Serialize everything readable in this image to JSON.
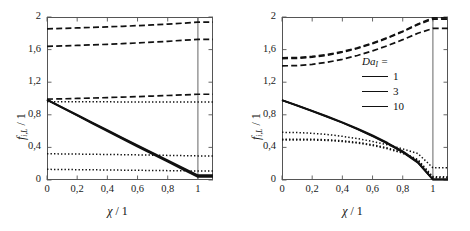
{
  "figure": {
    "panels": [
      {
        "id": "left",
        "axis": {
          "xlabel_sym": "χ",
          "xlabel_unit": "/ 1",
          "ylabel_sym": "f",
          "ylabel_subscript": "i,L",
          "ylabel_unit": "/ 1",
          "xticks": [
            "0",
            "0,2",
            "0,4",
            "0,6",
            "0,8",
            "1"
          ],
          "xtick_values": [
            0,
            0.2,
            0.4,
            0.6,
            0.8,
            1
          ],
          "yticks": [
            "0",
            "0,4",
            "0,8",
            "1,2",
            "1,6",
            "2"
          ],
          "ytick_values": [
            0,
            0.4,
            0.8,
            1.2,
            1.6,
            2
          ]
        }
      },
      {
        "id": "right",
        "axis": {
          "xlabel_sym": "χ",
          "xlabel_unit": "/ 1",
          "ylabel_sym": "f",
          "ylabel_subscript": "i,L",
          "ylabel_unit": "/ 1",
          "xticks": [
            "0",
            "0,2",
            "0,4",
            "0,6",
            "0,8",
            "1"
          ],
          "xtick_values": [
            0,
            0.2,
            0.4,
            0.6,
            0.8,
            1
          ],
          "yticks": [
            "0",
            "0,4",
            "0,8",
            "1,2",
            "1,6",
            "2"
          ],
          "ytick_values": [
            0,
            0.4,
            0.8,
            1.2,
            1.6,
            2
          ]
        },
        "legend": {
          "title_sym": "Da",
          "title_subscript": "I",
          "title_eq": "=",
          "entries": [
            {
              "label": "1",
              "width": 1.6
            },
            {
              "label": "3",
              "width": 1.6
            },
            {
              "label": "10",
              "width": 1.6
            }
          ]
        }
      }
    ]
  },
  "chart_data": [
    {
      "type": "line",
      "panel": "left",
      "title": "",
      "xlabel": "χ / 1",
      "ylabel": "f_{i,L} / 1",
      "xlim": [
        0,
        1.1
      ],
      "ylim": [
        0,
        2
      ],
      "xticks": [
        0,
        0.2,
        0.4,
        0.6,
        0.8,
        1
      ],
      "yticks": [
        0,
        0.4,
        0.8,
        1.2,
        1.6,
        2
      ],
      "grid": false,
      "legend_position": "none",
      "x": [
        0,
        0.1,
        0.2,
        0.3,
        0.4,
        0.5,
        0.6,
        0.7,
        0.8,
        0.9,
        1.0,
        1.05,
        1.1
      ],
      "series": [
        {
          "name": "dashed-upper-DaI-10",
          "style": "dashed",
          "values": [
            1.855,
            1.86,
            1.866,
            1.872,
            1.879,
            1.886,
            1.894,
            1.903,
            1.913,
            1.924,
            1.936,
            1.936,
            1.936
          ]
        },
        {
          "name": "dashed-mid-DaI-3",
          "style": "dashed",
          "values": [
            1.64,
            1.645,
            1.651,
            1.658,
            1.665,
            1.673,
            1.682,
            1.692,
            1.702,
            1.714,
            1.726,
            1.726,
            1.726
          ]
        },
        {
          "name": "dashed-low-DaI-1",
          "style": "dashed",
          "values": [
            0.992,
            0.996,
            1.001,
            1.006,
            1.011,
            1.017,
            1.023,
            1.03,
            1.037,
            1.044,
            1.052,
            1.052,
            1.052
          ]
        },
        {
          "name": "dotted-upper-DaI-1",
          "style": "dotted",
          "values": [
            0.96,
            0.96,
            0.96,
            0.959,
            0.959,
            0.958,
            0.958,
            0.957,
            0.957,
            0.956,
            0.956,
            0.956,
            0.956
          ]
        },
        {
          "name": "dotted-mid-DaI-3",
          "style": "dotted",
          "values": [
            0.322,
            0.32,
            0.318,
            0.316,
            0.313,
            0.311,
            0.308,
            0.305,
            0.302,
            0.299,
            0.296,
            0.296,
            0.296
          ]
        },
        {
          "name": "dotted-low-DaI-10",
          "style": "dotted",
          "values": [
            0.131,
            0.129,
            0.127,
            0.125,
            0.123,
            0.121,
            0.119,
            0.117,
            0.115,
            0.113,
            0.11,
            0.11,
            0.11
          ]
        },
        {
          "name": "solid-DaI-1",
          "style": "solid",
          "values": [
            0.988,
            0.894,
            0.8,
            0.706,
            0.613,
            0.52,
            0.427,
            0.334,
            0.242,
            0.15,
            0.06,
            0.06,
            0.06
          ]
        },
        {
          "name": "solid-DaI-3",
          "style": "solid",
          "values": [
            0.985,
            0.89,
            0.795,
            0.7,
            0.606,
            0.512,
            0.418,
            0.325,
            0.232,
            0.14,
            0.048,
            0.048,
            0.048
          ]
        },
        {
          "name": "solid-DaI-10",
          "style": "solid",
          "values": [
            0.982,
            0.886,
            0.79,
            0.694,
            0.599,
            0.504,
            0.409,
            0.315,
            0.222,
            0.129,
            0.037,
            0.037,
            0.037
          ]
        }
      ]
    },
    {
      "type": "line",
      "panel": "right",
      "title": "",
      "xlabel": "χ / 1",
      "ylabel": "f_{i,L} / 1",
      "xlim": [
        0,
        1.1
      ],
      "ylim": [
        0,
        2
      ],
      "xticks": [
        0,
        0.2,
        0.4,
        0.6,
        0.8,
        1
      ],
      "yticks": [
        0,
        0.4,
        0.8,
        1.2,
        1.6,
        2
      ],
      "grid": false,
      "legend_position": "center-right",
      "legend_entries": [
        "1",
        "3",
        "10"
      ],
      "legend_title": "Da_I =",
      "x": [
        0,
        0.1,
        0.2,
        0.3,
        0.4,
        0.5,
        0.6,
        0.7,
        0.8,
        0.9,
        1.0,
        1.05,
        1.1
      ],
      "series": [
        {
          "name": "dashed-DaI-10",
          "style": "dashed",
          "values": [
            1.5,
            1.503,
            1.516,
            1.54,
            1.576,
            1.622,
            1.68,
            1.748,
            1.826,
            1.913,
            1.99,
            1.99,
            1.99
          ]
        },
        {
          "name": "dashed-DaI-3",
          "style": "dashed",
          "values": [
            1.49,
            1.493,
            1.507,
            1.531,
            1.567,
            1.614,
            1.672,
            1.741,
            1.82,
            1.906,
            1.975,
            1.975,
            1.975
          ]
        },
        {
          "name": "dashed-DaI-1",
          "style": "dashed",
          "values": [
            1.4,
            1.404,
            1.419,
            1.445,
            1.481,
            1.528,
            1.584,
            1.649,
            1.722,
            1.8,
            1.86,
            1.86,
            1.86
          ]
        },
        {
          "name": "dotted-DaI-1",
          "style": "dotted",
          "values": [
            0.585,
            0.582,
            0.573,
            0.558,
            0.536,
            0.508,
            0.473,
            0.431,
            0.382,
            0.325,
            0.15,
            0.15,
            0.15
          ]
        },
        {
          "name": "dotted-DaI-3",
          "style": "dotted",
          "values": [
            0.5,
            0.501,
            0.5,
            0.494,
            0.482,
            0.462,
            0.433,
            0.392,
            0.337,
            0.251,
            0.04,
            0.04,
            0.04
          ]
        },
        {
          "name": "dotted-DaI-10",
          "style": "dotted",
          "values": [
            0.49,
            0.492,
            0.491,
            0.485,
            0.473,
            0.453,
            0.424,
            0.383,
            0.328,
            0.243,
            0.028,
            0.028,
            0.028
          ]
        },
        {
          "name": "solid-DaI-1",
          "style": "solid",
          "values": [
            0.98,
            0.916,
            0.85,
            0.782,
            0.71,
            0.632,
            0.548,
            0.456,
            0.353,
            0.224,
            0.01,
            0.01,
            0.01
          ]
        },
        {
          "name": "solid-DaI-3",
          "style": "solid",
          "values": [
            0.98,
            0.913,
            0.846,
            0.777,
            0.704,
            0.626,
            0.541,
            0.448,
            0.344,
            0.216,
            0.006,
            0.006,
            0.006
          ]
        },
        {
          "name": "solid-DaI-10",
          "style": "solid",
          "values": [
            0.98,
            0.911,
            0.843,
            0.774,
            0.701,
            0.622,
            0.537,
            0.443,
            0.339,
            0.211,
            0.004,
            0.004,
            0.004
          ]
        }
      ]
    }
  ]
}
